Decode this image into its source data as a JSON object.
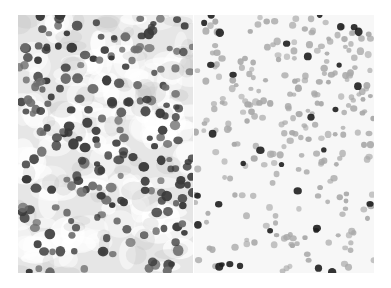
{
  "figure": {
    "panels": [
      {
        "id": "left",
        "description": "Densely packed cells, dark gray-stained nuclei on mottled light gray background",
        "background": "#e6e6e6",
        "cell_color_dark": "#3a3a3a",
        "cell_color_mid": "#6e6e6e"
      },
      {
        "id": "right",
        "description": "Scattered lighter gray nuclei with a few dark-stained cells on near-white background",
        "background": "#f7f7f7",
        "cell_color_light": "#a8a8a8",
        "cell_color_dark": "#1e1e1e"
      }
    ]
  }
}
